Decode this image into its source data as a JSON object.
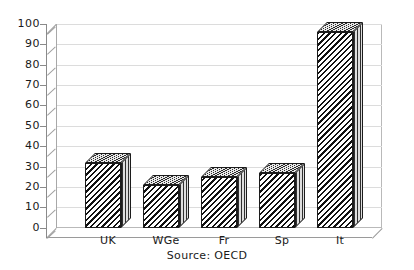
{
  "chart_data": {
    "type": "bar",
    "title": "",
    "subtitle": "",
    "xlabel": "",
    "ylabel": "",
    "categories": [
      "UK",
      "WGe",
      "Fr",
      "Sp",
      "It"
    ],
    "values": [
      32,
      21,
      25,
      27,
      96
    ],
    "series": [
      {
        "name": "",
        "values": [
          32,
          21,
          25,
          27,
          96
        ]
      }
    ],
    "ylim": [
      0,
      100
    ],
    "ytick_labels": [
      "100",
      "90",
      "80",
      "70",
      "60",
      "50",
      "40",
      "30",
      "20",
      "10",
      "0"
    ],
    "ytick_values": [
      100,
      90,
      80,
      70,
      60,
      50,
      40,
      30,
      20,
      10,
      0
    ],
    "grid": true,
    "legend": false,
    "legend_position": "none",
    "annotations": [
      "Source: OECD"
    ],
    "style": "3d-bar-hatched",
    "colors": {
      "bar_fill": "#111111",
      "bar_background": "#ffffff",
      "bar_outline": "#1c1c1c",
      "bar_top": "#cfcfcf",
      "bar_side": "#b8b8b8",
      "gridline": "#dcdcdc",
      "axis": "#8a8a8a",
      "frame": "#b9b9b9",
      "text": "#1a1a1a",
      "background": "#ffffff"
    }
  },
  "footer": {
    "source_text": "Source: OECD"
  }
}
